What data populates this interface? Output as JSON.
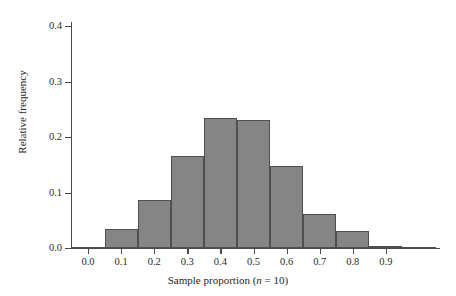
{
  "chart_data": {
    "type": "bar",
    "title": "",
    "subtitle": "",
    "xlabel": "Sample proportion (n = 10)",
    "xlabel_parts": {
      "before": "Sample proportion (",
      "italic": "n",
      "after": " = 10)"
    },
    "ylabel": "Relative frequency",
    "categories": [
      "0.0",
      "0.1",
      "0.2",
      "0.3",
      "0.4",
      "0.5",
      "0.6",
      "0.7",
      "0.8",
      "0.9",
      "1.0"
    ],
    "bin_centers": [
      0.0,
      0.1,
      0.2,
      0.3,
      0.4,
      0.5,
      0.6,
      0.7,
      0.8,
      0.9,
      1.0
    ],
    "bin_width": 0.1,
    "values": [
      0.001,
      0.034,
      0.086,
      0.165,
      0.235,
      0.23,
      0.148,
      0.062,
      0.03,
      0.004,
      0.0
    ],
    "xlim": [
      -0.05,
      1.0
    ],
    "ylim": [
      0.0,
      0.45
    ],
    "xticks": [
      "0.0",
      "0.1",
      "0.2",
      "0.3",
      "0.4",
      "0.5",
      "0.6",
      "0.7",
      "0.8",
      "0.9"
    ],
    "xtick_values": [
      0.0,
      0.1,
      0.2,
      0.3,
      0.4,
      0.5,
      0.6,
      0.7,
      0.8,
      0.9
    ],
    "yticks": [
      "0.0",
      "0.1",
      "0.2",
      "0.3",
      "0.4"
    ],
    "ytick_values": [
      0.0,
      0.1,
      0.2,
      0.3,
      0.4
    ],
    "grid": false,
    "legend": false,
    "legend_position": "none",
    "colors": {
      "bar_fill": "#858585",
      "bar_edge": "#4f4f4f",
      "axis": "#4a4a4a",
      "text": "#1f1f1f",
      "background": "#ffffff"
    }
  }
}
